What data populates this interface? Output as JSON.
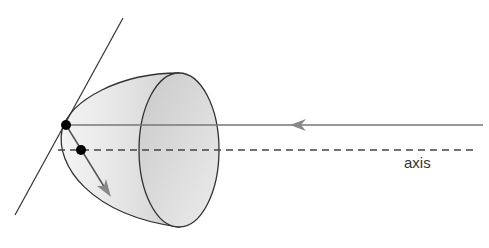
{
  "diagram": {
    "type": "parabolic-reflector",
    "labels": {
      "axis": "axis"
    },
    "colors": {
      "stroke": "#333333",
      "ray": "#777777",
      "arrow": "#888888",
      "fill_light": "#efefef",
      "fill_dark": "#c8c8c8",
      "dot": "#000000"
    }
  }
}
